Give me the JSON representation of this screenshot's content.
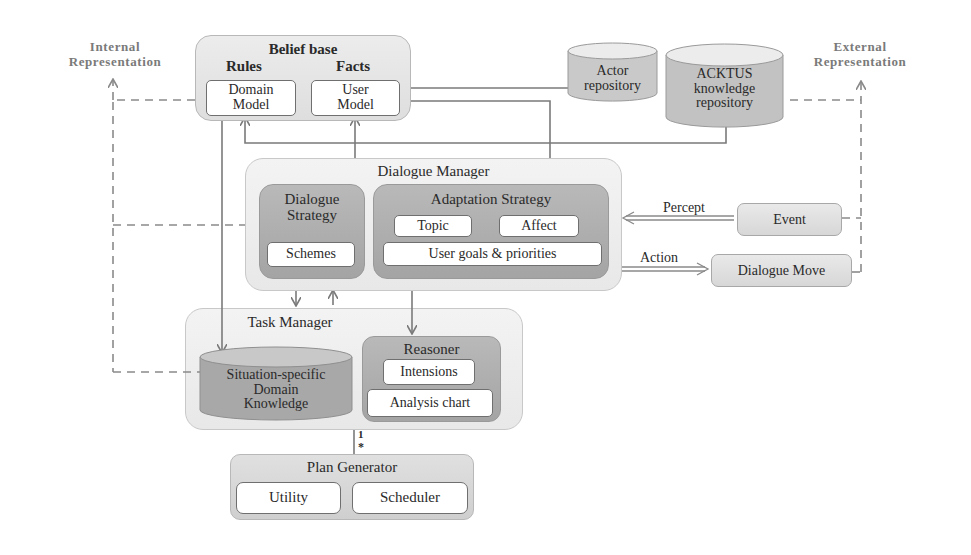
{
  "labels": {
    "internal_representation": [
      "Internal",
      "Representation"
    ],
    "external_representation": [
      "External",
      "Representation"
    ]
  },
  "belief_base": {
    "title": "Belief base",
    "rules_label": "Rules",
    "facts_label": "Facts",
    "domain_model": [
      "Domain",
      "Model"
    ],
    "user_model": [
      "User",
      "Model"
    ]
  },
  "repositories": {
    "actor": [
      "Actor",
      "repository"
    ],
    "acktus": [
      "ACKTUS",
      "knowledge",
      "repository"
    ]
  },
  "dialogue_manager": {
    "title": "Dialogue Manager",
    "dialogue_strategy": {
      "title": [
        "Dialogue",
        "Strategy"
      ],
      "schemes": "Schemes"
    },
    "adaptation_strategy": {
      "title": "Adaptation Strategy",
      "topic": "Topic",
      "affect": "Affect",
      "user_goals": "User goals & priorities"
    }
  },
  "io": {
    "percept_label": "Percept",
    "action_label": "Action",
    "event": "Event",
    "dialogue_move": "Dialogue Move"
  },
  "task_manager": {
    "title": "Task Manager",
    "situation_knowledge": [
      "Situation-specific",
      "Domain",
      "Knowledge"
    ],
    "reasoner": {
      "title": "Reasoner",
      "intensions": "Intensions",
      "analysis_chart": "Analysis chart"
    }
  },
  "multiplicity": {
    "one": "1",
    "many": "*"
  },
  "plan_generator": {
    "title": "Plan Generator",
    "utility": "Utility",
    "scheduler": "Scheduler"
  },
  "colors": {
    "line": "#7a7a7a",
    "dashed": "#8a8a8a",
    "outer_box": "#e4e4e4",
    "strategy_box": "#aeaeae",
    "inner_box": "#ffffff"
  }
}
